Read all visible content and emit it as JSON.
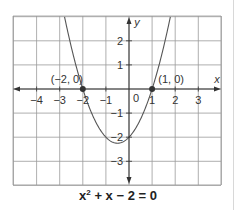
{
  "figure": {
    "caption": {
      "base": "x",
      "exponent": "2",
      "rest": " + x − 2 = 0"
    },
    "axes": {
      "x_label": "x",
      "y_label": "y",
      "origin_label": "0",
      "x_ticks": [
        {
          "value": -4,
          "label": "−4"
        },
        {
          "value": -3,
          "label": "−3"
        },
        {
          "value": -2,
          "label": "−2"
        },
        {
          "value": -1,
          "label": "−1"
        },
        {
          "value": 1,
          "label": "1"
        },
        {
          "value": 2,
          "label": "2"
        },
        {
          "value": 3,
          "label": "3"
        }
      ],
      "y_ticks": [
        {
          "value": 2,
          "label": "2"
        },
        {
          "value": 1,
          "label": "1"
        },
        {
          "value": -1,
          "label": "−1"
        },
        {
          "value": -2,
          "label": "−2"
        },
        {
          "value": -3,
          "label": "−3"
        }
      ]
    },
    "points": [
      {
        "x": -2,
        "y": 0,
        "label": "(−2, 0)"
      },
      {
        "x": 1,
        "y": 0,
        "label": "(1, 0)"
      }
    ],
    "curve": {
      "equation": "y = x^2 + x - 2"
    },
    "colors": {
      "grid": "#9a9a9a",
      "axis": "#333333",
      "curve": "#555555",
      "point": "#333333",
      "text": "#333333"
    }
  }
}
